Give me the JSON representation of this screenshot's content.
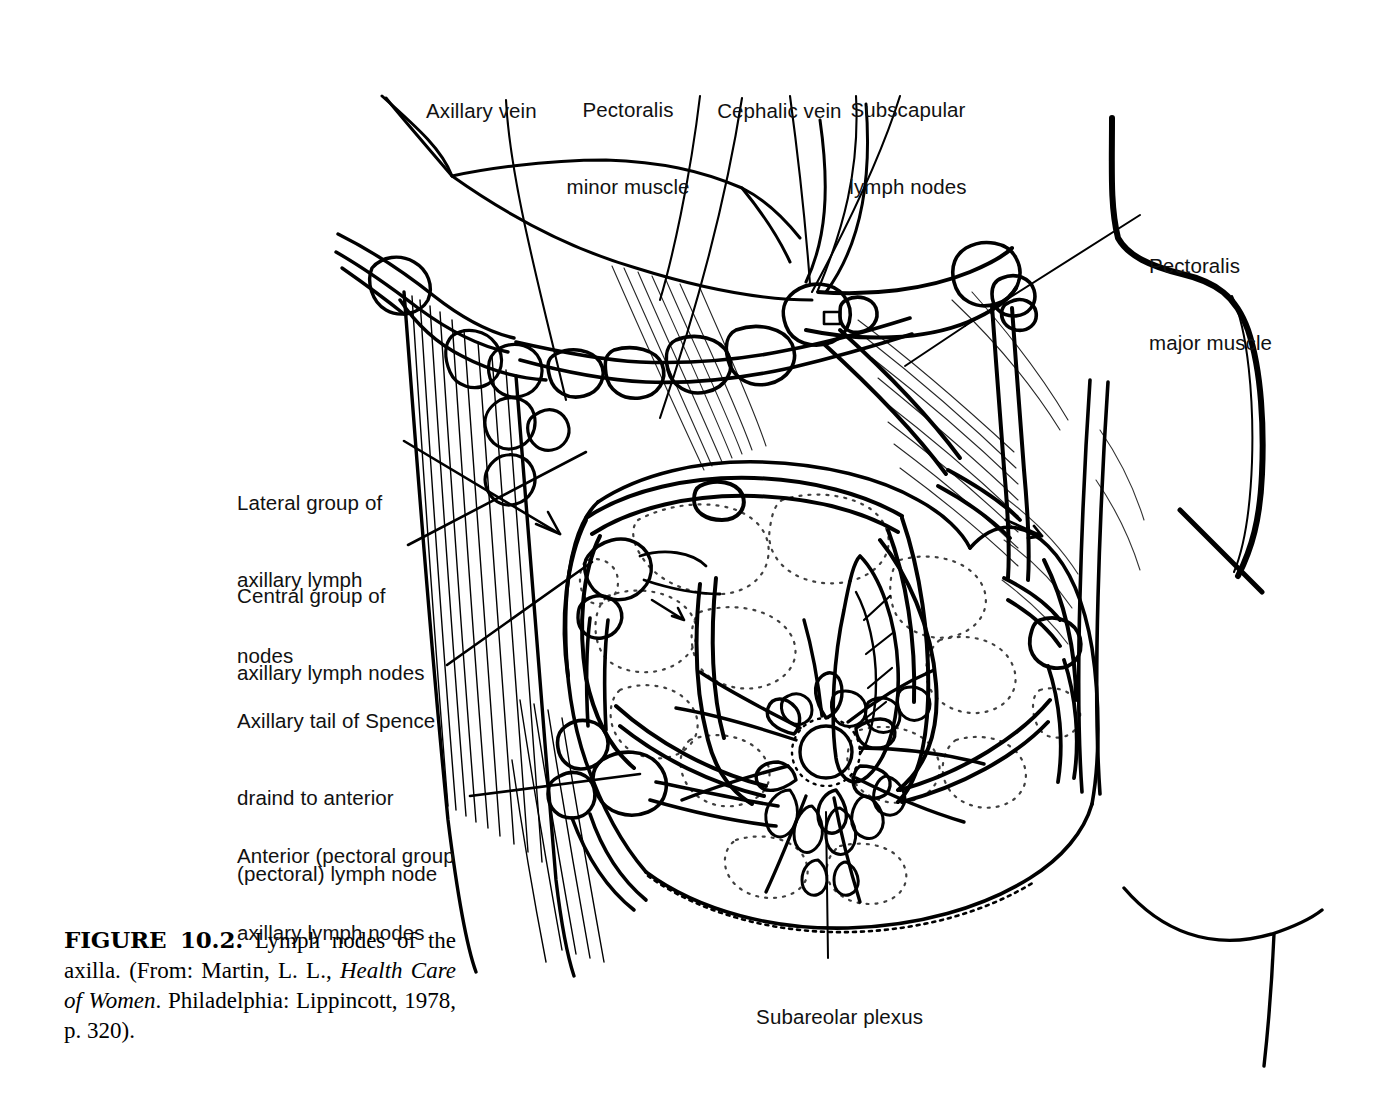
{
  "figure": {
    "id": "figure-10-2",
    "caption": {
      "label": "FIGURE 10.2.",
      "text_before_title": "  Lymph nodes of the axilla. (From: Martin, L. L.,",
      "book_title": "Health Care of Women",
      "text_after_title": ". Philadelphia: Lippincott, 1978, p. 320)."
    },
    "ink_color": "#000000",
    "background_color": "#ffffff"
  },
  "labels": {
    "axillary_vein": "Axillary vein",
    "pectoralis_minor_line1": "Pectoralis",
    "pectoralis_minor_line2": "minor muscle",
    "cephalic_vein": "Cephalic vein",
    "subscapular_line1": "Subscapular",
    "subscapular_line2": "lymph nodes",
    "pectoralis_major_line1": "Pectoralis",
    "pectoralis_major_line2": "major muscle",
    "lateral_group_line1": "Lateral group of",
    "lateral_group_line2": "axillary lymph",
    "lateral_group_line3": "nodes",
    "central_group_line1": "Central group of",
    "central_group_line2": "axillary lymph nodes",
    "axillary_tail_line1": "Axillary tail of Spence",
    "axillary_tail_line2": "draind to anterior",
    "axillary_tail_line3": "(pectoral) lymph node",
    "anterior_pectoral_line1": "Anterior (pectoral group",
    "anterior_pectoral_line2": "axillary lymph nodes",
    "subareolar_plexus": "Subareolar plexus"
  }
}
